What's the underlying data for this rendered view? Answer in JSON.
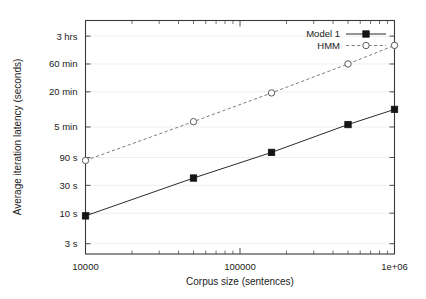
{
  "chart_data": {
    "type": "line",
    "title": "",
    "xlabel": "Corpus size (sentences)",
    "ylabel": "Average iteration latency (seconds)",
    "xscale": "log",
    "yscale": "log",
    "xlim": [
      10000,
      1000000
    ],
    "ylim": [
      2.0,
      20000
    ],
    "grid": true,
    "legend_position": "top-right",
    "x_ticks": [
      {
        "value": 10000,
        "label": "10000"
      },
      {
        "value": 100000,
        "label": "100000"
      },
      {
        "value": 1000000,
        "label": "1e+06"
      }
    ],
    "y_ticks": [
      {
        "value": 3,
        "label": "3 s"
      },
      {
        "value": 10,
        "label": "10 s"
      },
      {
        "value": 30,
        "label": "30 s"
      },
      {
        "value": 90,
        "label": "90 s"
      },
      {
        "value": 300,
        "label": "5 min"
      },
      {
        "value": 1200,
        "label": "20 min"
      },
      {
        "value": 3600,
        "label": "60 min"
      },
      {
        "value": 10800,
        "label": "3 hrs"
      }
    ],
    "series": [
      {
        "name": "Model 1",
        "marker": "filled-square",
        "line": "solid",
        "color": "#141414",
        "x": [
          10000,
          50000,
          160000,
          500000,
          1000000
        ],
        "values": [
          9,
          40,
          110,
          330,
          600
        ]
      },
      {
        "name": "HMM",
        "marker": "open-circle",
        "line": "dashed",
        "color": "#5a5a5a",
        "x": [
          10000,
          50000,
          160000,
          500000,
          1000000
        ],
        "values": [
          80,
          370,
          1150,
          3600,
          7500
        ]
      }
    ]
  },
  "legend": {
    "entries": [
      {
        "label": "Model 1"
      },
      {
        "label": "HMM"
      }
    ]
  },
  "axes": {
    "x_title": "Corpus size (sentences)",
    "y_title": "Average iteration latency (seconds)"
  }
}
